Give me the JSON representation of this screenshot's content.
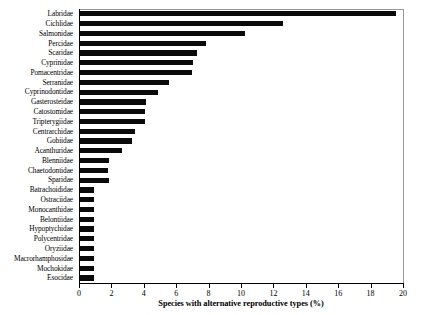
{
  "chart_data": {
    "type": "bar",
    "orientation": "horizontal",
    "title": "",
    "xlabel": "Species with alternative reproductive types (%)",
    "ylabel": "",
    "xlim": [
      0,
      20
    ],
    "xticks": [
      0,
      2,
      4,
      6,
      8,
      10,
      12,
      14,
      16,
      18,
      20
    ],
    "xticklabels": [
      "0",
      "2",
      "4",
      "6",
      "8",
      "10",
      "12",
      "14",
      "16",
      "18",
      "20"
    ],
    "grid": false,
    "legend": null,
    "bar_color": "#0a0a0a",
    "categories": [
      "Labridae",
      "Cichlidae",
      "Salmonidae",
      "Percidae",
      "Scaridae",
      "Cyprinidae",
      "Pomacentridae",
      "Serranidae",
      "Cyprinodontidae",
      "Gasterosteidae",
      "Catostomidae",
      "Tripterygiidae",
      "Centrarchidae",
      "Gobiidae",
      "Acanthuridae",
      "Blenniidae",
      "Chaetodontidae",
      "Sparidae",
      "Batrachoididae",
      "Ostraciidae",
      "Monocanthidae",
      "Belontiidae",
      "Hypoptychidae",
      "Polycentridae",
      "Oryziidae",
      "Macrorhamphosidae",
      "Mochokidae",
      "Esocidae"
    ],
    "values": [
      19.5,
      12.5,
      10.2,
      7.8,
      7.2,
      7.0,
      6.9,
      5.5,
      4.8,
      4.1,
      4.0,
      4.0,
      3.4,
      3.2,
      2.6,
      1.8,
      1.75,
      1.8,
      0.85,
      0.85,
      0.85,
      0.85,
      0.85,
      0.85,
      0.85,
      0.85,
      0.85,
      0.85
    ]
  }
}
